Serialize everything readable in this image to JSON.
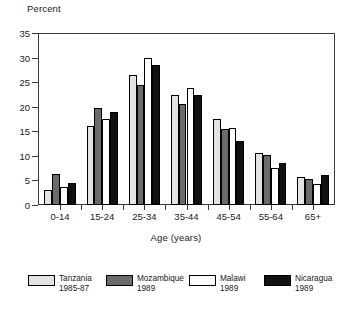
{
  "chart_data": {
    "type": "bar",
    "title": "",
    "ylabel": "Percent",
    "xlabel": "Age (years)",
    "categories": [
      "0-14",
      "15-24",
      "25-34",
      "35-44",
      "45-54",
      "55-64",
      "65+"
    ],
    "ylim": [
      0,
      35
    ],
    "yticks": [
      0,
      5,
      10,
      15,
      20,
      25,
      30,
      35
    ],
    "grid": false,
    "legend_position": "bottom",
    "series": [
      {
        "name": "Tanzania",
        "period": "1985-87",
        "fill": "light-dotted",
        "color": "#e3e3e3",
        "values": [
          3.1,
          16.0,
          26.5,
          22.4,
          17.6,
          10.6,
          5.7
        ]
      },
      {
        "name": "Mozambique",
        "period": "1989",
        "fill": "dark-checker",
        "color": "#6b6b6b",
        "values": [
          6.4,
          19.8,
          24.4,
          20.5,
          15.4,
          10.1,
          5.3
        ]
      },
      {
        "name": "Malawi",
        "period": "1989",
        "fill": "white",
        "color": "#ffffff",
        "values": [
          3.6,
          17.5,
          29.9,
          23.9,
          15.6,
          7.6,
          4.3
        ]
      },
      {
        "name": "Nicaragua",
        "period": "1989",
        "fill": "black",
        "color": "#111111",
        "values": [
          4.5,
          19.0,
          28.5,
          22.4,
          13.1,
          8.6,
          6.1
        ]
      }
    ]
  }
}
